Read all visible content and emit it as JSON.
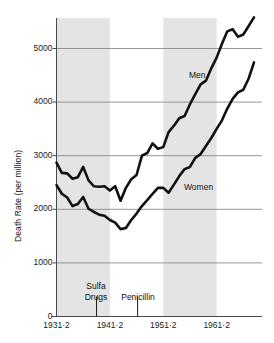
{
  "chart_data": {
    "type": "line",
    "title": "",
    "xlabel": "",
    "ylabel": "Death Rate (per million)",
    "ylim": [
      0,
      5600
    ],
    "xlim": [
      1931,
      1970
    ],
    "grid": true,
    "legend_position": "inline-annotation",
    "y_ticks": [
      0,
      1000,
      2000,
      3000,
      4000,
      5000
    ],
    "y_tick_labels": [
      "0",
      "1000",
      "2000",
      "3000",
      "4000",
      "5000"
    ],
    "x_ticks": [
      1931,
      1941,
      1951,
      1961
    ],
    "x_tick_labels": [
      "1931·2",
      "1941·2",
      "1951·2",
      "1961·2"
    ],
    "series": [
      {
        "name": "Men",
        "label": "Men",
        "x": [
          1931,
          1932,
          1933,
          1934,
          1935,
          1936,
          1937,
          1938,
          1939,
          1940,
          1941,
          1942,
          1943,
          1944,
          1945,
          1946,
          1947,
          1948,
          1949,
          1950,
          1951,
          1952,
          1953,
          1954,
          1955,
          1956,
          1957,
          1958,
          1959,
          1960,
          1961,
          1962,
          1963,
          1964,
          1965,
          1966,
          1967,
          1968
        ],
        "values": [
          2870,
          2680,
          2670,
          2570,
          2600,
          2790,
          2540,
          2430,
          2420,
          2430,
          2350,
          2430,
          2160,
          2400,
          2560,
          2640,
          3000,
          3050,
          3230,
          3130,
          3160,
          3440,
          3560,
          3700,
          3740,
          3960,
          4150,
          4330,
          4400,
          4630,
          4830,
          5090,
          5320,
          5360,
          5220,
          5260,
          5420,
          5580
        ]
      },
      {
        "name": "Women",
        "label": "Women",
        "x": [
          1931,
          1932,
          1933,
          1934,
          1935,
          1936,
          1937,
          1938,
          1939,
          1940,
          1941,
          1942,
          1943,
          1944,
          1945,
          1946,
          1947,
          1948,
          1949,
          1950,
          1951,
          1952,
          1953,
          1954,
          1955,
          1956,
          1957,
          1958,
          1959,
          1960,
          1961,
          1962,
          1963,
          1964,
          1965,
          1966,
          1967,
          1968
        ],
        "values": [
          2450,
          2290,
          2220,
          2060,
          2100,
          2230,
          2010,
          1950,
          1900,
          1880,
          1800,
          1750,
          1630,
          1650,
          1800,
          1920,
          2060,
          2170,
          2290,
          2400,
          2400,
          2310,
          2460,
          2620,
          2750,
          2790,
          2960,
          3030,
          3180,
          3330,
          3500,
          3660,
          3880,
          4060,
          4180,
          4230,
          4440,
          4740
        ]
      }
    ],
    "shaded_bands": [
      {
        "name": "band-1931-1941",
        "x_start": 1931,
        "x_end": 1941
      },
      {
        "name": "band-1951-1961",
        "x_start": 1951,
        "x_end": 1961
      }
    ],
    "annotations": [
      {
        "name": "sulfa-drugs",
        "label_line1": "Sulfa",
        "label_line2": "Drugs",
        "x": 1938.5
      },
      {
        "name": "penicillin",
        "label_line1": "Penicillin",
        "label_line2": "",
        "x": 1946.2
      }
    ],
    "colors": {
      "line": "#111111",
      "grid": "#8a8a8a",
      "axis": "#4a4a4a",
      "band": "#e4e4e4",
      "background": "#ffffff",
      "text": "#1a1a1a"
    }
  }
}
